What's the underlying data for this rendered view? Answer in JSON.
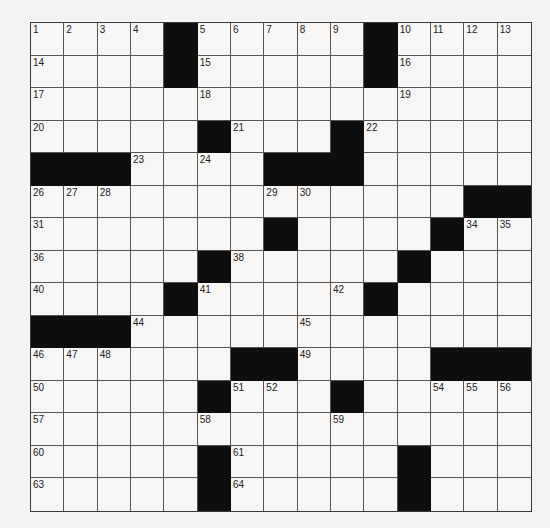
{
  "puzzle": {
    "type": "crossword",
    "size": {
      "rows": 15,
      "cols": 15
    },
    "colors": {
      "black_square": "#0e0e0e",
      "white_square": "#f7f6f4",
      "grid_line": "#555555"
    },
    "layout": [
      "....#.....#....",
      "....#.....#....",
      "...............",
      ".....#...#.....",
      "###....###.....",
      ".............###",
      ".......#....#...",
      ".....#.....#....",
      "....#.....#.....",
      "###............",
      "......##....###",
      ".....#...#.....",
      "...............",
      ".....#.....#....",
      ".....#.....#...."
    ],
    "numbers": [
      {
        "n": 1,
        "r": 0,
        "c": 0
      },
      {
        "n": 2,
        "r": 0,
        "c": 1
      },
      {
        "n": 3,
        "r": 0,
        "c": 2
      },
      {
        "n": 4,
        "r": 0,
        "c": 3
      },
      {
        "n": 5,
        "r": 0,
        "c": 5
      },
      {
        "n": 6,
        "r": 0,
        "c": 6
      },
      {
        "n": 7,
        "r": 0,
        "c": 7
      },
      {
        "n": 8,
        "r": 0,
        "c": 8
      },
      {
        "n": 9,
        "r": 0,
        "c": 9
      },
      {
        "n": 10,
        "r": 0,
        "c": 11
      },
      {
        "n": 11,
        "r": 0,
        "c": 12
      },
      {
        "n": 12,
        "r": 0,
        "c": 13
      },
      {
        "n": 13,
        "r": 0,
        "c": 14
      },
      {
        "n": 14,
        "r": 1,
        "c": 0
      },
      {
        "n": 15,
        "r": 1,
        "c": 5
      },
      {
        "n": 16,
        "r": 1,
        "c": 11
      },
      {
        "n": 17,
        "r": 2,
        "c": 0
      },
      {
        "n": 18,
        "r": 2,
        "c": 5
      },
      {
        "n": 19,
        "r": 2,
        "c": 11
      },
      {
        "n": 20,
        "r": 3,
        "c": 0
      },
      {
        "n": 21,
        "r": 3,
        "c": 6
      },
      {
        "n": 22,
        "r": 3,
        "c": 10
      },
      {
        "n": 23,
        "r": 4,
        "c": 3
      },
      {
        "n": 24,
        "r": 4,
        "c": 5
      },
      {
        "n": 25,
        "r": 4,
        "c": 9
      },
      {
        "n": 26,
        "r": 5,
        "c": 0
      },
      {
        "n": 27,
        "r": 5,
        "c": 1
      },
      {
        "n": 28,
        "r": 5,
        "c": 2
      },
      {
        "n": 29,
        "r": 5,
        "c": 7
      },
      {
        "n": 30,
        "r": 5,
        "c": 8
      },
      {
        "n": 31,
        "r": 6,
        "c": 0
      },
      {
        "n": 32,
        "r": 6,
        "c": 7
      },
      {
        "n": 33,
        "r": 6,
        "c": 12
      },
      {
        "n": 34,
        "r": 6,
        "c": 13
      },
      {
        "n": 35,
        "r": 6,
        "c": 14
      },
      {
        "n": 36,
        "r": 7,
        "c": 0
      },
      {
        "n": 37,
        "r": 7,
        "c": 5
      },
      {
        "n": 38,
        "r": 7,
        "c": 6
      },
      {
        "n": 39,
        "r": 7,
        "c": 11
      },
      {
        "n": 40,
        "r": 8,
        "c": 0
      },
      {
        "n": 41,
        "r": 8,
        "c": 5
      },
      {
        "n": 42,
        "r": 8,
        "c": 9
      },
      {
        "n": 43,
        "r": 8,
        "c": 10
      },
      {
        "n": 44,
        "r": 9,
        "c": 3
      },
      {
        "n": 45,
        "r": 9,
        "c": 8
      },
      {
        "n": 46,
        "r": 10,
        "c": 0
      },
      {
        "n": 47,
        "r": 10,
        "c": 1
      },
      {
        "n": 48,
        "r": 10,
        "c": 2
      },
      {
        "n": 49,
        "r": 10,
        "c": 8
      },
      {
        "n": 50,
        "r": 11,
        "c": 0
      },
      {
        "n": 51,
        "r": 11,
        "c": 6
      },
      {
        "n": 52,
        "r": 11,
        "c": 7
      },
      {
        "n": 53,
        "r": 11,
        "c": 9
      },
      {
        "n": 54,
        "r": 11,
        "c": 12
      },
      {
        "n": 55,
        "r": 11,
        "c": 13
      },
      {
        "n": 56,
        "r": 11,
        "c": 14
      },
      {
        "n": 57,
        "r": 12,
        "c": 0
      },
      {
        "n": 58,
        "r": 12,
        "c": 5
      },
      {
        "n": 59,
        "r": 12,
        "c": 9
      },
      {
        "n": 60,
        "r": 13,
        "c": 0
      },
      {
        "n": 61,
        "r": 13,
        "c": 6
      },
      {
        "n": 62,
        "r": 13,
        "c": 11
      },
      {
        "n": 63,
        "r": 14,
        "c": 0
      },
      {
        "n": 64,
        "r": 14,
        "c": 6
      },
      {
        "n": 65,
        "r": 14,
        "c": 11
      }
    ]
  }
}
